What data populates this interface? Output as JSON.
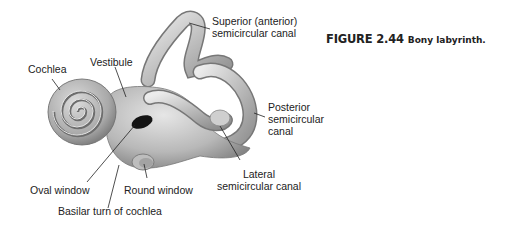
{
  "figure": {
    "number": "FIGURE 2.44",
    "caption": "Bony labyrinth."
  },
  "labels": {
    "superior": [
      "Superior (anterior)",
      "semicircular canal"
    ],
    "posterior": [
      "Posterior",
      "semicircular",
      "canal"
    ],
    "lateral": [
      "Lateral",
      "semicircular canal"
    ],
    "cochlea": "Cochlea",
    "vestibule": "Vestibule",
    "oval_window": "Oval window",
    "round_window": "Round window",
    "basilar_turn": "Basilar turn of cochlea"
  },
  "colors": {
    "structure_fill": "#b9b9b9",
    "structure_light": "#e2e2e2",
    "structure_dark": "#7a7a7a",
    "text": "#222222",
    "leader_line": "#222222"
  }
}
